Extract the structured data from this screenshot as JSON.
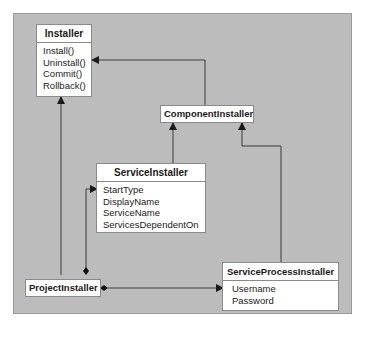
{
  "diagram": {
    "type": "uml-class-diagram",
    "colors": {
      "background": "#ffffff",
      "panel": "#bcbcbc",
      "box_fill": "#ffffff",
      "line": "#3a3a3a"
    },
    "classes": {
      "installer": {
        "name": "Installer",
        "members": [
          "Install()",
          "Uninstall()",
          "Commit()",
          "Rollback()"
        ]
      },
      "component_installer": {
        "name": "ComponentInstaller"
      },
      "service_installer": {
        "name": "ServiceInstaller",
        "members": [
          "StartType",
          "DisplayName",
          "ServiceName",
          "ServicesDependentOn"
        ]
      },
      "project_installer": {
        "name": "ProjectInstaller"
      },
      "service_process_installer": {
        "name": "ServiceProcessInstaller",
        "members": [
          "Username",
          "Password"
        ]
      }
    },
    "relationships": [
      {
        "from": "ComponentInstaller",
        "to": "Installer",
        "kind": "inheritance"
      },
      {
        "from": "ProjectInstaller",
        "to": "Installer",
        "kind": "inheritance"
      },
      {
        "from": "ServiceInstaller",
        "to": "ComponentInstaller",
        "kind": "inheritance"
      },
      {
        "from": "ServiceProcessInstaller",
        "to": "ComponentInstaller",
        "kind": "inheritance"
      },
      {
        "from": "ProjectInstaller",
        "to": "ServiceInstaller",
        "kind": "composition"
      },
      {
        "from": "ProjectInstaller",
        "to": "ServiceProcessInstaller",
        "kind": "composition"
      }
    ]
  }
}
